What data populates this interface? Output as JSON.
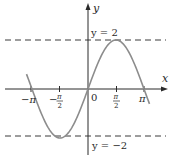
{
  "chart_data": {
    "type": "line",
    "title": "",
    "function": "y = 2 sin x",
    "xlabel": "x",
    "ylabel": "y",
    "xlim": [
      -3.45,
      3.45
    ],
    "ylim": [
      -2.4,
      3.1
    ],
    "grid": false,
    "legend": null,
    "x_ticks": [
      {
        "value": -3.1416,
        "label": "−π"
      },
      {
        "value": -1.5708,
        "label": "−π/2"
      },
      {
        "value": 0,
        "label": "0"
      },
      {
        "value": 1.5708,
        "label": "π/2"
      },
      {
        "value": 3.1416,
        "label": "π"
      }
    ],
    "series": [
      {
        "name": "2 sin x",
        "color": "#8c8c8c",
        "x": [
          -3.45,
          -3.1416,
          -2.3562,
          -1.5708,
          -0.7854,
          0,
          0.7854,
          1.5708,
          2.3562,
          3.1416,
          3.45
        ],
        "y": [
          0.61,
          0,
          -1.414,
          -2,
          -1.414,
          0,
          1.414,
          2,
          1.414,
          0,
          -0.61
        ]
      }
    ],
    "reference_lines": [
      {
        "orientation": "horizontal",
        "y": 2,
        "style": "dashed",
        "label": "y = 2"
      },
      {
        "orientation": "horizontal",
        "y": -2,
        "style": "dashed",
        "label": "y = −2"
      }
    ],
    "annotations": [
      "y = 2",
      "y = −2"
    ]
  },
  "labels": {
    "x_axis": "x",
    "y_axis": "y",
    "origin": "0",
    "tick_neg_pi": "−π",
    "tick_neg_pi_half_minus": "−",
    "tick_pi_half_num": "π",
    "tick_half_den": "2",
    "tick_pi": "π",
    "line_upper": "y = 2",
    "line_lower": "y = −2"
  },
  "colors": {
    "curve": "#8c8c8c",
    "axes": "#2a2a2a",
    "dashes": "#3a3a3a"
  }
}
